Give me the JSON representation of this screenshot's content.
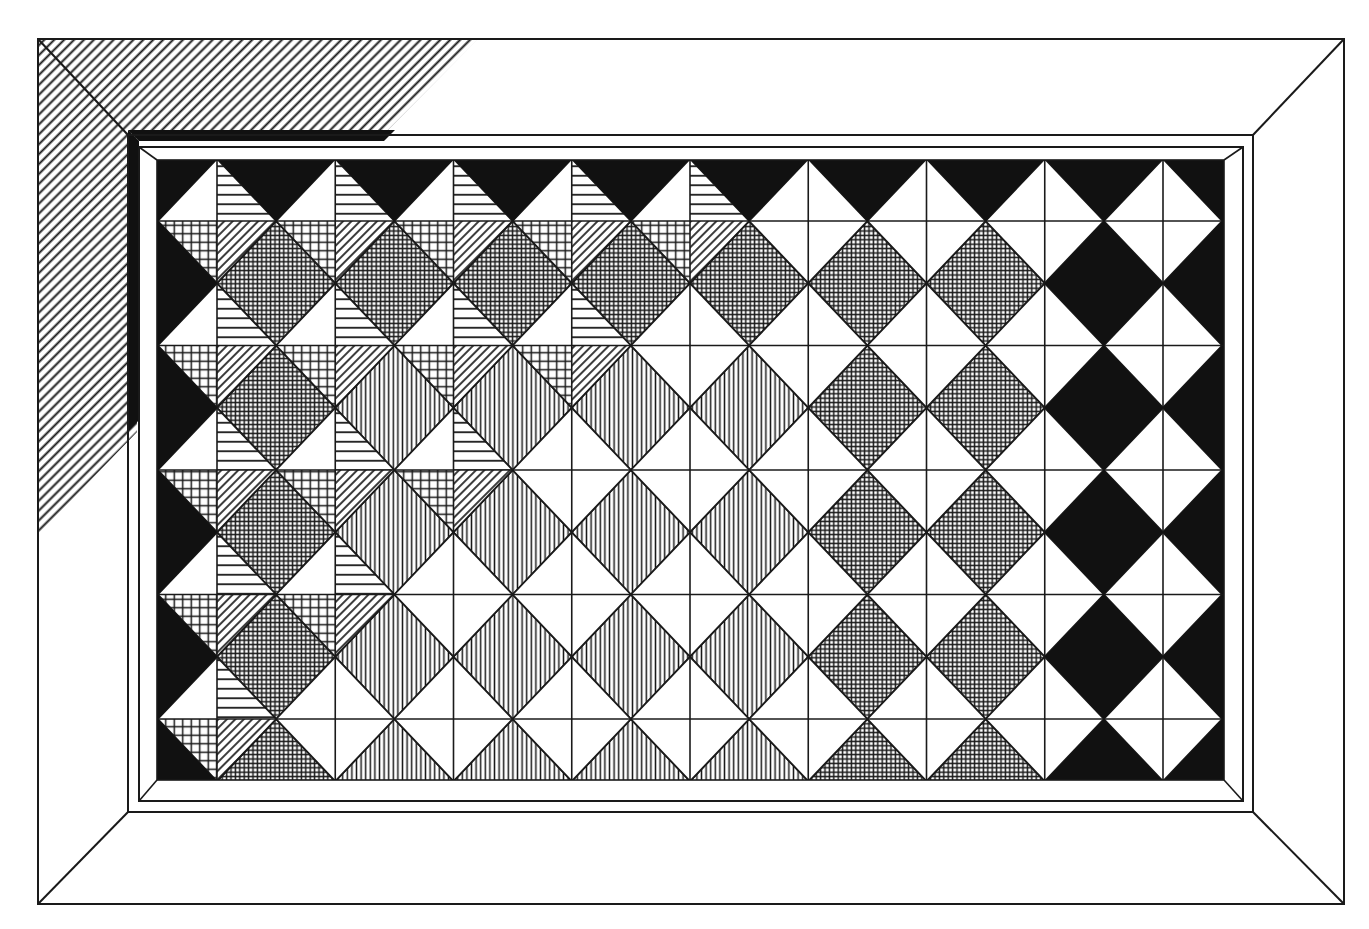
{
  "figure": {
    "canvas": {
      "width": 1369,
      "height": 929
    },
    "colors": {
      "ink": "#1a1a1a",
      "paper": "#ffffff",
      "solid": "#111111"
    }
  },
  "frame": {
    "outer": [
      38,
      39,
      1344,
      904
    ],
    "band_outer": [
      128,
      135,
      1253,
      812
    ],
    "band_inner": [
      139,
      147,
      1243,
      801
    ],
    "panel": [
      157,
      160,
      1224,
      780
    ],
    "shadow_hatch": {
      "pattern": "diagonal-lines",
      "polygon": [
        [
          38,
          39
        ],
        [
          478,
          39
        ],
        [
          388,
          130
        ],
        [
          137,
          130
        ],
        [
          137,
          432
        ],
        [
          38,
          535
        ]
      ]
    },
    "shadow_strips": {
      "top": [
        [
          128,
          130
        ],
        [
          395,
          130
        ],
        [
          384,
          141
        ],
        [
          139,
          141
        ]
      ],
      "left": [
        [
          128,
          130
        ],
        [
          139,
          141
        ],
        [
          139,
          420
        ],
        [
          128,
          432
        ]
      ]
    }
  },
  "grid": {
    "x0": 217,
    "dx": 118.25,
    "columns": 9,
    "y0": 221,
    "dy": 124.5,
    "rows": 5,
    "half_w": 59.1,
    "half_h": 62.2
  },
  "legend_of_fills": {
    "B": "solid black",
    "C": "fine crosshatch grid",
    "V": "vertical lines",
    "W": "white",
    "P": "quartered: white / horizontal lines / square grid / diagonal lines"
  },
  "upright_diamonds": {
    "note": "centered on grid intersections (column k, row j); P = patterned quarters, W = plain",
    "rows": [
      [
        "P",
        "P",
        "P",
        "P",
        "P",
        "W",
        "W",
        "W",
        "W"
      ],
      [
        "P",
        "P",
        "P",
        "P",
        "W",
        "W",
        "W",
        "W",
        "W"
      ],
      [
        "P",
        "P",
        "P",
        "W",
        "W",
        "W",
        "W",
        "W",
        "W"
      ],
      [
        "P",
        "P",
        "W",
        "W",
        "W",
        "W",
        "W",
        "W",
        "W"
      ],
      [
        "P",
        "W",
        "W",
        "W",
        "W",
        "W",
        "W",
        "W",
        "W"
      ]
    ]
  },
  "offset_diamonds": {
    "note": "centered between columns, half a row above each grid row; index 0 = left edge half, 1..8 = between columns, 9 = right edge half",
    "rows": [
      [
        "B",
        "B",
        "B",
        "B",
        "B",
        "B",
        "B",
        "B",
        "B",
        "B"
      ],
      [
        "B",
        "C",
        "C",
        "C",
        "C",
        "C",
        "C",
        "C",
        "B",
        "B"
      ],
      [
        "B",
        "C",
        "V",
        "V",
        "V",
        "V",
        "C",
        "C",
        "B",
        "B"
      ],
      [
        "B",
        "C",
        "V",
        "V",
        "V",
        "V",
        "C",
        "C",
        "B",
        "B"
      ],
      [
        "B",
        "C",
        "V",
        "V",
        "V",
        "V",
        "C",
        "C",
        "B",
        "B"
      ],
      [
        "B",
        "C",
        "V",
        "V",
        "V",
        "V",
        "C",
        "C",
        "B",
        "B"
      ]
    ]
  }
}
